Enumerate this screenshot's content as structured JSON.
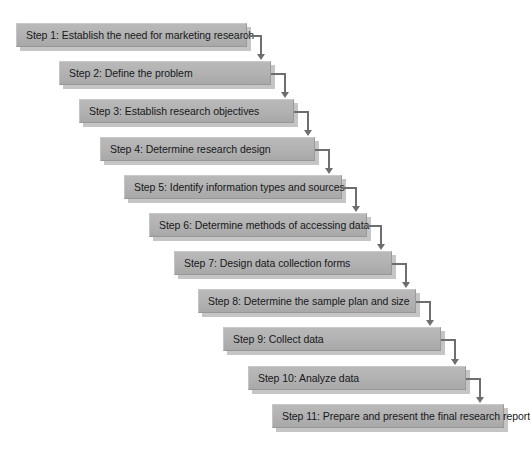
{
  "diagram": {
    "background_color": "#ffffff",
    "box_fill_color": "#b3b3b3",
    "box_shadow_color": "#969696",
    "connector_color": "#6e6e6e",
    "text_color": "#17181a",
    "steps": [
      {
        "label": "Step 1: Establish the need for marketing research",
        "x": 16,
        "y": 23,
        "width": 231,
        "has_connector": true
      },
      {
        "label": "Step 2: Define the problem",
        "x": 59,
        "y": 61,
        "width": 212,
        "has_connector": true
      },
      {
        "label": "Step 3: Establish research objectives",
        "x": 79,
        "y": 99,
        "width": 215,
        "has_connector": true
      },
      {
        "label": "Step 4: Determine research design",
        "x": 100,
        "y": 137,
        "width": 215,
        "has_connector": true
      },
      {
        "label": "Step 5: Identify information types and sources",
        "x": 124,
        "y": 175,
        "width": 218,
        "has_connector": true
      },
      {
        "label": "Step 6: Determine methods of accessing data",
        "x": 149,
        "y": 213,
        "width": 218,
        "has_connector": true
      },
      {
        "label": "Step 7: Design data collection forms",
        "x": 174,
        "y": 251,
        "width": 218,
        "has_connector": true
      },
      {
        "label": "Step 8: Determine the sample plan and size",
        "x": 198,
        "y": 289,
        "width": 218,
        "has_connector": true
      },
      {
        "label": "Step 9: Collect data",
        "x": 223,
        "y": 327,
        "width": 218,
        "has_connector": true
      },
      {
        "label": "Step 10: Analyze data",
        "x": 248,
        "y": 366,
        "width": 218,
        "has_connector": true
      },
      {
        "label": "Step 11: Prepare and present the final research report",
        "x": 272,
        "y": 404,
        "width": 232,
        "has_connector": false
      }
    ]
  }
}
